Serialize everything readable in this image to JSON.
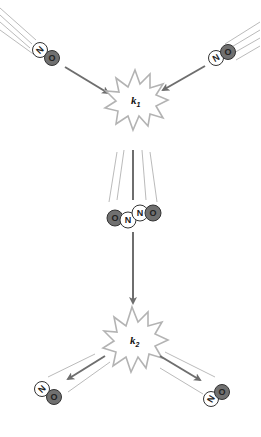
{
  "diagram": {
    "type": "reaction-mechanism",
    "colors": {
      "nitrogen_atom": "#ffffff",
      "oxygen_atom": "#707070",
      "atom_outline": "#333333",
      "arrow": "#6e6e6e",
      "burst_outline": "#b3b3b3",
      "motion_lines": "#a8a8a8"
    },
    "reactants": [
      {
        "id": "no-left",
        "atoms": [
          "N",
          "O"
        ]
      },
      {
        "id": "no-right",
        "atoms": [
          "N",
          "O"
        ]
      }
    ],
    "collision1": {
      "label": "k",
      "subscript": "1"
    },
    "intermediate": {
      "id": "onno",
      "atoms": [
        "O",
        "N",
        "N",
        "O"
      ]
    },
    "collision2": {
      "label": "k",
      "subscript": "2"
    },
    "products": [
      {
        "id": "no-bottom-left",
        "atoms": [
          "N",
          "O"
        ]
      },
      {
        "id": "no-bottom-right",
        "atoms": [
          "N",
          "O"
        ]
      }
    ]
  }
}
